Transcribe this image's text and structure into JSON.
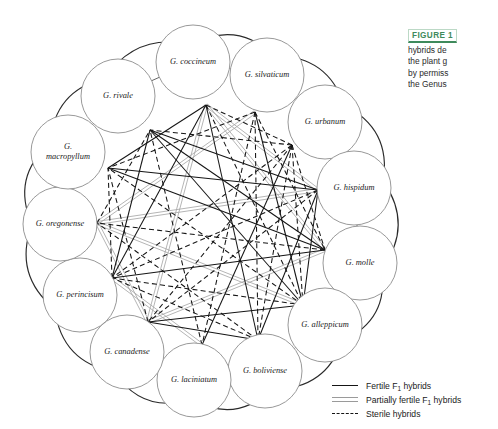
{
  "figure": {
    "caption_tag": "FIGURE 1",
    "caption_lines": [
      "hybrids de",
      "the plant g",
      "by permiss",
      "the Genus"
    ],
    "tag_color": "#3f8a5c"
  },
  "diagram": {
    "type": "network-graph",
    "node_count": 14,
    "nodes": [
      {
        "id": "coccineum",
        "label": "G. coccineum",
        "cx": 193,
        "cy": 62,
        "r": 37,
        "hub_x": 206,
        "hub_y": 105
      },
      {
        "id": "silvaticum",
        "label": "G. silvaticum",
        "cx": 267,
        "cy": 75,
        "r": 37,
        "hub_x": 255,
        "hub_y": 112
      },
      {
        "id": "urbanum",
        "label": "G. urbanum",
        "cx": 325,
        "cy": 122,
        "r": 37,
        "hub_x": 292,
        "hub_y": 145
      },
      {
        "id": "hispidum",
        "label": "G. hispidum",
        "cx": 354,
        "cy": 188,
        "r": 37,
        "hub_x": 318,
        "hub_y": 190
      },
      {
        "id": "molle",
        "label": "G. molle",
        "cx": 360,
        "cy": 263,
        "r": 37,
        "hub_x": 325,
        "hub_y": 250
      },
      {
        "id": "alleppicum",
        "label": "G. alleppicum",
        "cx": 325,
        "cy": 325,
        "r": 37,
        "hub_x": 303,
        "hub_y": 305
      },
      {
        "id": "boliviense",
        "label": "G. boliviense",
        "cx": 265,
        "cy": 371,
        "r": 37,
        "hub_x": 258,
        "hub_y": 340
      },
      {
        "id": "laciniatum",
        "label": "G. laciniatum",
        "cx": 194,
        "cy": 380,
        "r": 37,
        "hub_x": 202,
        "hub_y": 345
      },
      {
        "id": "canadense",
        "label": "G. canadense",
        "cx": 127,
        "cy": 352,
        "r": 37,
        "hub_x": 148,
        "hub_y": 322
      },
      {
        "id": "perincisum",
        "label": "G. perincisum",
        "cx": 80,
        "cy": 295,
        "r": 37,
        "hub_x": 112,
        "hub_y": 278
      },
      {
        "id": "oregonense",
        "label": "G. oregonense",
        "cx": 60,
        "cy": 224,
        "r": 37,
        "hub_x": 97,
        "hub_y": 223
      },
      {
        "id": "macropyllum",
        "label": "G. macropyllum",
        "cx": 68,
        "cy": 152,
        "r": 37,
        "hub_x": 108,
        "hub_y": 168
      },
      {
        "id": "rivale",
        "label": "G. rivale",
        "cx": 118,
        "cy": 96,
        "r": 37,
        "hub_x": 150,
        "hub_y": 130
      },
      {
        "id": "coccineum2",
        "label": "",
        "cx": 193,
        "cy": 62,
        "r": 0,
        "hub_x": 206,
        "hub_y": 105
      }
    ],
    "node_labels_two_line": [
      "macropyllum"
    ],
    "edge_types": {
      "fertile": {
        "style": "solid",
        "color": "#151515"
      },
      "partial": {
        "style": "double",
        "color": "#a8a8a8"
      },
      "sterile": {
        "style": "dashed",
        "color": "#151515"
      }
    }
  },
  "legend": {
    "items": [
      {
        "swatch": "fertile",
        "pre": "Fertile F",
        "sub": "1",
        "post": " hybrids"
      },
      {
        "swatch": "partial",
        "pre": "Partially fertile F",
        "sub": "1",
        "post": " hybrids"
      },
      {
        "swatch": "sterile",
        "pre": "Sterile hybrids",
        "sub": "",
        "post": ""
      }
    ]
  }
}
